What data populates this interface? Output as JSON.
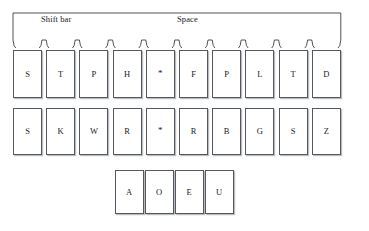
{
  "diagram": {
    "bar": {
      "shift_label": "Shift bar",
      "space_label": "Space",
      "scallop_count": 10
    },
    "geometry": {
      "width": 369,
      "height": 231,
      "key_width": 29,
      "column_step": 33.2,
      "first_column_left": 13
    },
    "colors": {
      "key_border": "#55585c",
      "key_shadow": "#b9bcc0",
      "key_fill": "#ffffff",
      "text": "#1a1a1a",
      "background": "#ffffff"
    },
    "rows": [
      {
        "name": "top-consonant-row",
        "keys": [
          {
            "label": "S",
            "name": "key-s-left-top"
          },
          {
            "label": "T",
            "name": "key-t-left"
          },
          {
            "label": "P",
            "name": "key-p-left"
          },
          {
            "label": "H",
            "name": "key-h-left"
          },
          {
            "label": "*",
            "name": "key-asterisk-top"
          },
          {
            "label": "F",
            "name": "key-f-right"
          },
          {
            "label": "P",
            "name": "key-p-right"
          },
          {
            "label": "L",
            "name": "key-l-right"
          },
          {
            "label": "T",
            "name": "key-t-right"
          },
          {
            "label": "D",
            "name": "key-d-right"
          }
        ]
      },
      {
        "name": "bottom-consonant-row",
        "keys": [
          {
            "label": "S",
            "name": "key-s-left-bottom"
          },
          {
            "label": "K",
            "name": "key-k-left"
          },
          {
            "label": "W",
            "name": "key-w-left"
          },
          {
            "label": "R",
            "name": "key-r-left"
          },
          {
            "label": "*",
            "name": "key-asterisk-bottom"
          },
          {
            "label": "R",
            "name": "key-r-right"
          },
          {
            "label": "B",
            "name": "key-b-right"
          },
          {
            "label": "G",
            "name": "key-g-right"
          },
          {
            "label": "S",
            "name": "key-s-right"
          },
          {
            "label": "Z",
            "name": "key-z-right"
          }
        ]
      },
      {
        "name": "vowel-row",
        "keys": [
          {
            "label": "A",
            "name": "key-a-vowel"
          },
          {
            "label": "O",
            "name": "key-o-vowel"
          },
          {
            "label": "E",
            "name": "key-e-vowel"
          },
          {
            "label": "U",
            "name": "key-u-vowel"
          }
        ]
      }
    ]
  }
}
